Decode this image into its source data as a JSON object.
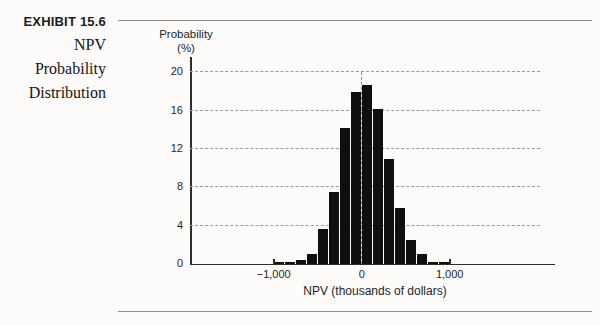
{
  "exhibit": {
    "label": "EXHIBIT 15.6",
    "title_lines": [
      "NPV",
      "Probability",
      "Distribution"
    ]
  },
  "chart_data": {
    "type": "bar",
    "title": "NPV Probability Distribution",
    "ylabel_lines": [
      "Probability",
      "(%)"
    ],
    "xlabel": "NPV (thousands of dollars)",
    "bin_edges": [
      -1000,
      -875,
      -750,
      -625,
      -500,
      -375,
      -250,
      -125,
      0,
      125,
      250,
      375,
      500,
      625,
      750,
      875,
      1000
    ],
    "values": [
      0.2,
      0.2,
      0.4,
      1.0,
      3.7,
      7.5,
      14.2,
      18.0,
      18.7,
      16.2,
      11.0,
      5.9,
      2.5,
      1.0,
      0.2,
      0.2
    ],
    "yticks": [
      0,
      4,
      8,
      12,
      16,
      20
    ],
    "xticks": [
      -1000,
      1000
    ],
    "xtick_labels": [
      {
        "value": -1000,
        "label": "−1,000"
      },
      {
        "value": 0,
        "label": "0"
      },
      {
        "value": 1000,
        "label": "1,000"
      }
    ],
    "ylim": [
      0,
      20
    ],
    "xlim": [
      -1000,
      1000
    ],
    "grid": "horizontal-dashed",
    "zero_reference_line": true,
    "legend": "none",
    "bar_color": "#0f0f0f"
  }
}
